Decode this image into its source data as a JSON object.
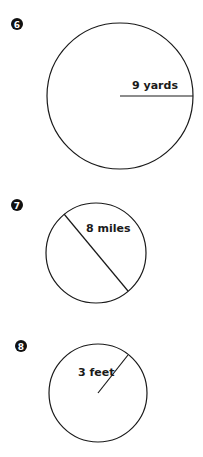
{
  "problems": [
    {
      "number": "6",
      "measure": "radius",
      "label": "9 yards",
      "circle": {
        "cx": 120,
        "cy": 96,
        "r": 73
      },
      "segment": {
        "x1": 120,
        "y1": 96,
        "x2": 193,
        "y2": 96
      },
      "label_pos": {
        "x": 135,
        "y": 89
      },
      "badge_pos": {
        "x": 17,
        "y": 24
      }
    },
    {
      "number": "7",
      "measure": "diameter",
      "label": "8 miles",
      "circle": {
        "cx": 96,
        "cy": 253,
        "r": 50
      },
      "segment": {
        "x1": 64,
        "y1": 214,
        "x2": 128,
        "y2": 291
      },
      "label_pos": {
        "x": 87,
        "y": 232
      },
      "badge_pos": {
        "x": 17,
        "y": 205
      }
    },
    {
      "number": "8",
      "measure": "radius",
      "label": "3 feet",
      "circle": {
        "cx": 98,
        "cy": 393,
        "r": 49
      },
      "segment": {
        "x1": 98,
        "y1": 393,
        "x2": 128,
        "y2": 355
      },
      "label_pos": {
        "x": 79,
        "y": 376
      },
      "badge_pos": {
        "x": 21,
        "y": 346
      }
    }
  ],
  "colors": {
    "stroke": "#1a1a1a",
    "badge": "#111111",
    "background": "#ffffff"
  }
}
